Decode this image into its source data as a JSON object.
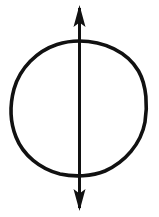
{
  "figure": {
    "type": "geometric-diagram",
    "background_color": "#ffffff",
    "stroke_color": "#111111",
    "canvas": {
      "width": 159,
      "height": 217
    },
    "labels": {
      "none": ""
    }
  },
  "chart_data": {
    "type": "scatter",
    "title": "",
    "xlabel": "",
    "ylabel": "",
    "grid": false,
    "legend_position": "none",
    "xlim": [
      0,
      159
    ],
    "ylim": [
      0,
      217
    ],
    "shapes": [
      {
        "name": "circle",
        "kind": "circle",
        "center_x": 79,
        "center_y": 108,
        "radius": 67,
        "stroke_width": 3.6,
        "stroke_color": "#111111",
        "fill": "none"
      },
      {
        "name": "vertical-axis-arrow",
        "kind": "double-headed-arrow",
        "x": 79,
        "y_start": 5,
        "y_end": 211,
        "shaft_width": 3.0,
        "arrowhead_width": 12,
        "arrowhead_length": 22,
        "stroke_color": "#111111"
      }
    ]
  },
  "elements": {
    "circle_label": "circle",
    "arrow_label": "vertical double-headed arrow",
    "top_arrowhead_label": "up arrowhead",
    "bottom_arrowhead_label": "down arrowhead",
    "shaft_label": "arrow shaft"
  }
}
